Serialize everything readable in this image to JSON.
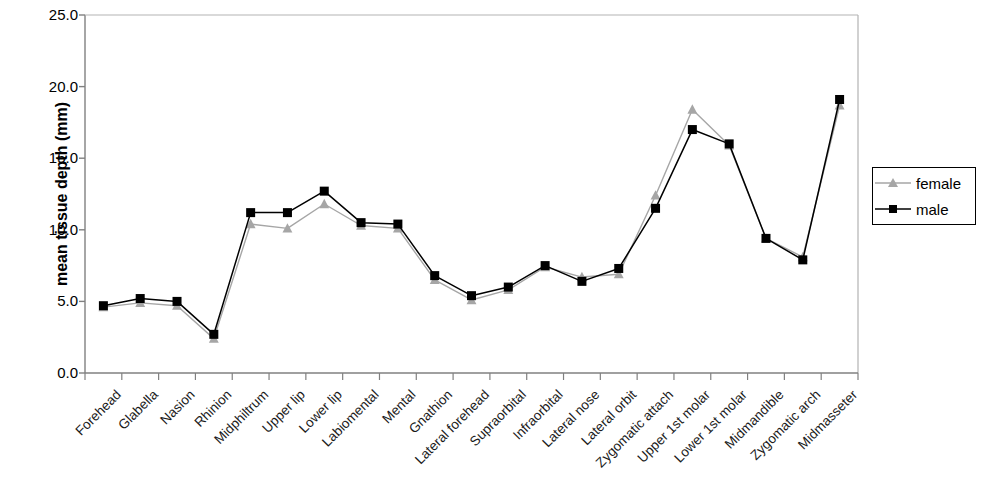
{
  "chart_data": {
    "type": "line",
    "title": "",
    "xlabel": "",
    "ylabel": "mean tissue depth (mm)",
    "ylim": [
      0.0,
      25.0
    ],
    "yticks": [
      "0.0",
      "5.0",
      "10.0",
      "15.0",
      "20.0",
      "25.0"
    ],
    "ytick_values": [
      0.0,
      5.0,
      10.0,
      15.0,
      20.0,
      25.0
    ],
    "grid": false,
    "legend_position": "right",
    "categories": [
      "Forehead",
      "Glabella",
      "Nasion",
      "Rhinion",
      "Midphiltrum",
      "Upper lip",
      "Lower lip",
      "Labiomental",
      "Mental",
      "Gnathion",
      "Lateral forehead",
      "Supraorbital",
      "Infraorbital",
      "Lateral nose",
      "Lateral orbit",
      "Zygomatic attach",
      "Upper 1st molar",
      "Lower 1st molar",
      "Midmandible",
      "Zygomatic arch",
      "Midmasseter"
    ],
    "series": [
      {
        "name": "female",
        "color": "#a6a6a6",
        "marker": "triangle",
        "values": [
          4.6,
          4.9,
          4.7,
          2.4,
          10.4,
          10.1,
          11.8,
          10.3,
          10.1,
          6.5,
          5.1,
          5.8,
          7.4,
          6.7,
          6.9,
          12.4,
          18.4,
          15.9,
          9.4,
          8.1,
          18.7
        ]
      },
      {
        "name": "male",
        "color": "#000000",
        "marker": "square",
        "values": [
          4.7,
          5.2,
          5.0,
          2.7,
          11.2,
          11.2,
          12.7,
          10.5,
          10.4,
          6.8,
          5.4,
          6.0,
          7.5,
          6.4,
          7.3,
          11.5,
          17.0,
          16.0,
          9.4,
          7.9,
          19.1
        ]
      }
    ]
  },
  "legend": {
    "entries": [
      {
        "label": "female"
      },
      {
        "label": "male"
      }
    ]
  }
}
